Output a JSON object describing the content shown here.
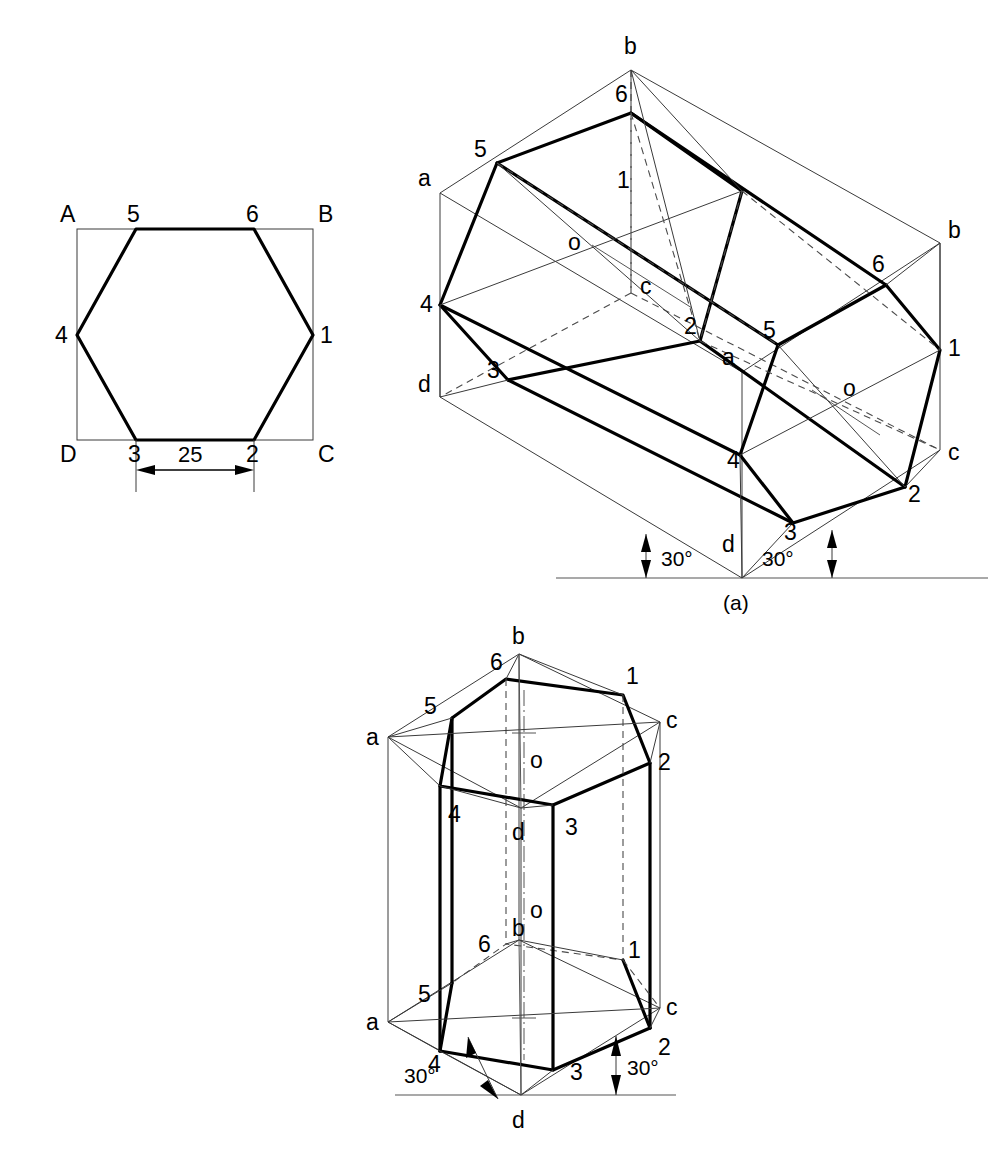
{
  "document": {
    "title": "Isometric projection of hexagonal prism",
    "background_color": "#ffffff",
    "line_color": "#000000",
    "thin_line_color": "#3a3a3a",
    "hidden_line_color": "#4a4a4a"
  },
  "fig_hexagon": {
    "name": "Enclosing-square hexagon construction",
    "square_corner_labels": {
      "top_left": "A",
      "top_right": "B",
      "bottom_right": "C",
      "bottom_left": "D"
    },
    "vertex_labels": [
      "1",
      "2",
      "3",
      "4",
      "5",
      "6"
    ],
    "dimension": {
      "value": "25",
      "description": "side of hexagon across flats base edge 3-2"
    }
  },
  "fig_a": {
    "caption": "(a)",
    "box_corner_labels_left": [
      "a",
      "d"
    ],
    "box_corner_labels_right": [
      "b",
      "c"
    ],
    "box_corner_labels_mid": [
      "b",
      "a",
      "c",
      "d"
    ],
    "near_face_vertices": [
      "1",
      "2",
      "3",
      "4",
      "5",
      "6"
    ],
    "far_face_vertices": [
      "1",
      "2",
      "3",
      "4",
      "5",
      "6"
    ],
    "centre_labels": [
      "o",
      "o"
    ],
    "angles": [
      "30°",
      "30°"
    ]
  },
  "fig_b": {
    "caption": "",
    "top_face_box_labels": [
      "a",
      "b",
      "c",
      "d"
    ],
    "bottom_face_box_labels": [
      "a",
      "b",
      "c",
      "d"
    ],
    "top_vertices": [
      "1",
      "2",
      "3",
      "4",
      "5",
      "6"
    ],
    "bottom_vertices": [
      "1",
      "2",
      "3",
      "4",
      "5",
      "6"
    ],
    "centre_labels": [
      "o",
      "o"
    ],
    "angles": [
      "30°",
      "30°"
    ]
  },
  "labels": {
    "A": "A",
    "B": "B",
    "C": "C",
    "D": "D",
    "a": "a",
    "b": "b",
    "c": "c",
    "d": "d",
    "o": "o",
    "n1": "1",
    "n2": "2",
    "n3": "3",
    "n4": "4",
    "n5": "5",
    "n6": "6",
    "dim25": "25",
    "deg30": "30°",
    "fig_a": "(a)"
  }
}
